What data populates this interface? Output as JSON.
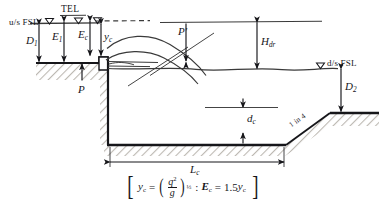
{
  "diagram": {
    "colors": {
      "ink": "#16161a",
      "structure_fill": "#ffffff",
      "ground_hatch": "#b9b5ae",
      "water_line": "#3a3a3a"
    },
    "labels": {
      "us_fsl": "u/s FSL",
      "tel": "TEL",
      "ds_fsl": "d/s FSL",
      "slope": "1 in 4"
    },
    "dimensions": [
      {
        "id": "D1",
        "base": "D",
        "sub": "1",
        "desc": "upstream depth from u/s FSL to upstream bed"
      },
      {
        "id": "E1",
        "base": "E",
        "sub": "1",
        "desc": "upstream specific energy"
      },
      {
        "id": "Ec",
        "base": "E",
        "sub": "c",
        "desc": "critical specific energy at crest"
      },
      {
        "id": "yc",
        "base": "y",
        "sub": "c",
        "desc": "critical depth over crest"
      },
      {
        "id": "P",
        "base": "P",
        "sub": "",
        "desc": "crest height above upstream bed"
      },
      {
        "id": "Pd",
        "base": "P",
        "sub": "",
        "prime": "'",
        "desc": "crest height above downstream water surface"
      },
      {
        "id": "Hdr",
        "base": "H",
        "sub": "dr",
        "desc": "drop head from TEL to d/s FSL"
      },
      {
        "id": "D2",
        "base": "D",
        "sub": "2",
        "desc": "downstream depth from d/s FSL to downstream bed"
      },
      {
        "id": "dc",
        "base": "d",
        "sub": "c",
        "desc": "depth of stilling basin floor below d/s FSL"
      },
      {
        "id": "Lc",
        "base": "L",
        "sub": "c",
        "desc": "length of the cistern / stilling basin"
      }
    ],
    "formula": {
      "open_bracket": "[",
      "close_bracket": "]",
      "lhs_base": "y",
      "lhs_sub": "c",
      "equals": "=",
      "frac_num_base": "q",
      "frac_num_sup": "2",
      "frac_den": "g",
      "exponent": "⅓",
      "separator": ":",
      "rhs_base": "E",
      "rhs_sub": "c",
      "rhs_equals": "=",
      "rhs_value": "1.5",
      "rhs_var_base": "y",
      "rhs_var_sub": "c"
    }
  }
}
